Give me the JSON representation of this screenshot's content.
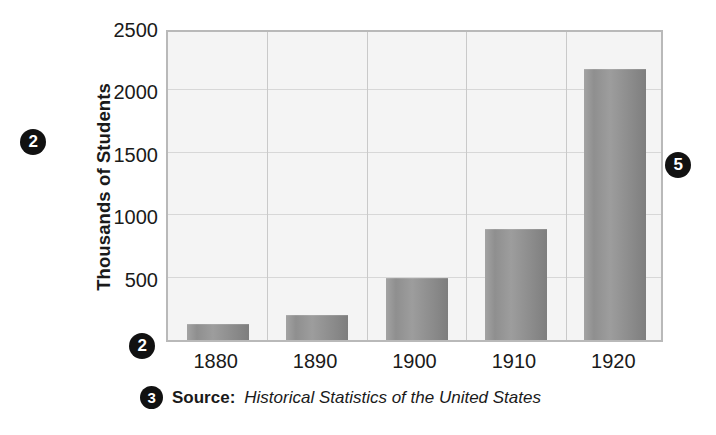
{
  "chart_data": {
    "type": "bar",
    "title": "",
    "xlabel": "",
    "ylabel": "Thousands of Students",
    "categories": [
      "1880",
      "1890",
      "1900",
      "1910",
      "1920"
    ],
    "values": [
      125,
      200,
      500,
      890,
      2170
    ],
    "ylim": [
      0,
      2500
    ],
    "yticks": [
      500,
      1000,
      1500,
      2000,
      2500
    ],
    "ytick_labels": [
      "500",
      "1000",
      "1500",
      "2000",
      "2500"
    ],
    "grid": "horizontal-and-vertical",
    "legend": "none",
    "bar_color": "#939393",
    "plot_background": "#f4f4f4",
    "annotations": [
      {
        "label": "2",
        "position": "left-of-y-axis-title"
      },
      {
        "label": "2",
        "position": "bottom-left-of-plot"
      },
      {
        "label": "3",
        "position": "left-of-source-line"
      },
      {
        "label": "4",
        "position": "above-1910-bar"
      },
      {
        "label": "5",
        "position": "right-of-plot"
      }
    ]
  },
  "source": {
    "label": "Source:",
    "title": "Historical Statistics of the United States"
  },
  "callouts": {
    "c2a": "2",
    "c2b": "2",
    "c3": "3",
    "c4": "4",
    "c5": "5"
  }
}
